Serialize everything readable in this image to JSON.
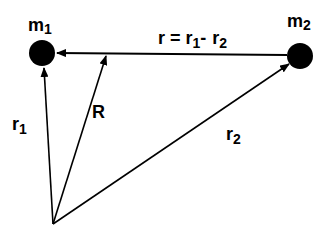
{
  "diagram": {
    "masses": [
      {
        "id": "m1",
        "label": "m",
        "subscript": "1",
        "x": 42,
        "y": 53,
        "r": 13
      },
      {
        "id": "m2",
        "label": "m",
        "subscript": "2",
        "x": 300,
        "y": 56,
        "r": 13
      }
    ],
    "origin": {
      "x": 53,
      "y": 224
    },
    "vectors": [
      {
        "id": "r1",
        "label": "r",
        "subscript": "1",
        "from": "origin",
        "to": "m1"
      },
      {
        "id": "R",
        "label": "R",
        "from": "origin",
        "to": "center-of-mass-point"
      },
      {
        "id": "r2",
        "label": "r",
        "subscript": "2",
        "from": "origin",
        "to": "m2"
      },
      {
        "id": "r",
        "from": "m2",
        "to": "m1"
      }
    ],
    "relation": {
      "lhs": "r",
      "eq": "=",
      "t1": "r",
      "t1_sub": "1",
      "minus": "-",
      "t2": "r",
      "t2_sub": "2"
    },
    "colors": {
      "ink": "#000000",
      "background": "#ffffff"
    }
  }
}
